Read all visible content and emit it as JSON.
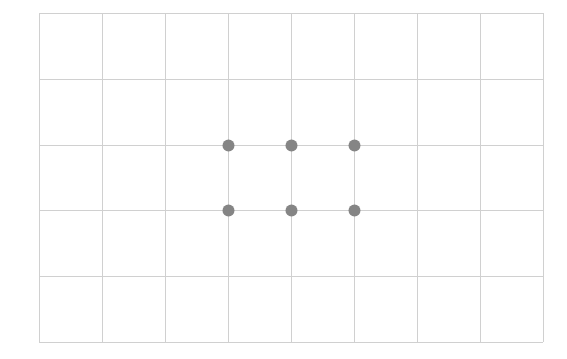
{
  "grid": {
    "left": 39,
    "top": 13,
    "cols": 8,
    "rows": 5,
    "cell_width": 63,
    "cell_height": 65.8,
    "line_color": "#d0d0d0",
    "line_width": 1
  },
  "dots": {
    "color": "#858585",
    "radius": 6,
    "points": [
      {
        "col": 3,
        "row": 2
      },
      {
        "col": 4,
        "row": 2
      },
      {
        "col": 5,
        "row": 2
      },
      {
        "col": 3,
        "row": 3
      },
      {
        "col": 4,
        "row": 3
      },
      {
        "col": 5,
        "row": 3
      }
    ]
  }
}
